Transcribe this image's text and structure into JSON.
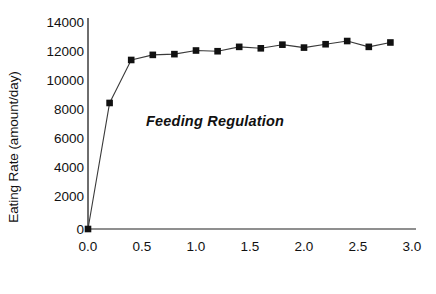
{
  "chart_data": {
    "type": "line",
    "title": "",
    "annotation": "Feeding Regulation",
    "xlabel": "\"Bite\" Size (arbitrary units)",
    "ylabel": "Eating Rate (amount/day)",
    "xlim": [
      0.0,
      3.0
    ],
    "ylim": [
      0,
      14000
    ],
    "xticks": [
      "0.0",
      "0.5",
      "1.0",
      "1.5",
      "2.0",
      "2.5",
      "3.0"
    ],
    "xtick_values": [
      0.0,
      0.5,
      1.0,
      1.5,
      2.0,
      2.5,
      3.0
    ],
    "yticks": [
      "0",
      "2000",
      "4000",
      "6000",
      "8000",
      "10000",
      "12000",
      "14000"
    ],
    "ytick_values": [
      0,
      2000,
      4000,
      6000,
      8000,
      10000,
      12000,
      14000
    ],
    "grid": false,
    "legend": false,
    "marker": "square",
    "marker_color": "#111111",
    "line_color": "#3a3a3a",
    "axis_color": "#4a4a4a",
    "series": [
      {
        "name": "Eating Rate",
        "x": [
          0.0,
          0.2,
          0.4,
          0.6,
          0.8,
          1.0,
          1.2,
          1.4,
          1.6,
          1.8,
          2.0,
          2.2,
          2.4,
          2.6,
          2.8
        ],
        "values": [
          0,
          8650,
          11600,
          11950,
          12000,
          12250,
          12200,
          12500,
          12400,
          12650,
          12450,
          12680,
          12900,
          12500,
          12800
        ]
      }
    ]
  },
  "axes": {
    "ylabel": "Eating Rate (amount/day)",
    "xlabel": "\"Bite\" Size (arbitrary units)"
  },
  "annotation": {
    "text": "Feeding Regulation"
  }
}
